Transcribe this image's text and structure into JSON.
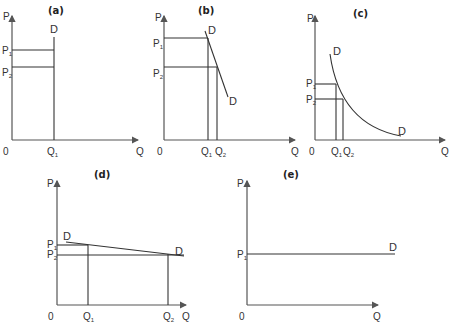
{
  "figure": {
    "panels": [
      {
        "id": "a",
        "title": "(a)",
        "y_label": "P",
        "x_label": "Q",
        "origin": "0",
        "curve_label": "D",
        "prices": [
          "P",
          "P"
        ],
        "price_subs": [
          "1",
          "2"
        ],
        "quantities": [
          "Q"
        ],
        "quantity_subs": [
          "1"
        ],
        "description": "Perfectly inelastic demand (vertical D)"
      },
      {
        "id": "b",
        "title": "(b)",
        "y_label": "P",
        "x_label": "Q",
        "origin": "0",
        "curve_label": "D",
        "prices": [
          "P",
          "P"
        ],
        "price_subs": [
          "1",
          "2"
        ],
        "quantities": [
          "Q",
          "Q"
        ],
        "quantity_subs": [
          "1",
          "2"
        ],
        "description": "Relatively inelastic demand (steep D)"
      },
      {
        "id": "c",
        "title": "(c)",
        "y_label": "P",
        "x_label": "Q",
        "origin": "0",
        "curve_label": "D",
        "prices": [
          "P",
          "P"
        ],
        "price_subs": [
          "1",
          "2"
        ],
        "quantities": [
          "Q",
          "Q"
        ],
        "quantity_subs": [
          "1",
          "2"
        ],
        "description": "Unit elastic demand (rectangular hyperbola D)"
      },
      {
        "id": "d",
        "title": "(d)",
        "y_label": "P",
        "x_label": "Q",
        "origin": "0",
        "curve_label": "D",
        "prices": [
          "P",
          "P"
        ],
        "price_subs": [
          "1",
          "2"
        ],
        "quantities": [
          "Q",
          "Q"
        ],
        "quantity_subs": [
          "1",
          "2"
        ],
        "description": "Relatively elastic demand (flat D)"
      },
      {
        "id": "e",
        "title": "(e)",
        "y_label": "P",
        "x_label": "Q",
        "origin": "0",
        "curve_label": "D",
        "prices": [
          "P"
        ],
        "price_subs": [
          "1"
        ],
        "quantities": [],
        "quantity_subs": [],
        "description": "Perfectly elastic demand (horizontal D)"
      }
    ]
  },
  "colors": {
    "axis": "#555555",
    "line": "#333333",
    "text": "#333333"
  }
}
